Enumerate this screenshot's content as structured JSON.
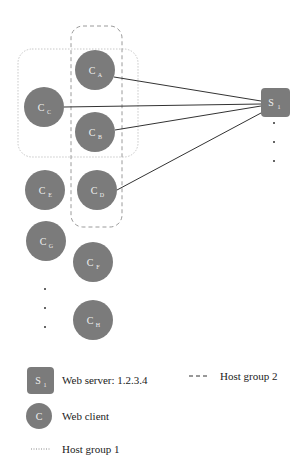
{
  "diagram": {
    "colors": {
      "node_fill": "#7b7b7b",
      "node_text": "#f2f2f2",
      "edge": "#333333",
      "host_group_1": "#c8c8c8",
      "host_group_2": "#9a9a9a"
    },
    "server": {
      "id": "S1",
      "main": "S",
      "sub": "1",
      "x": 261,
      "y": 88,
      "w": 29,
      "h": 29
    },
    "server_continuation_dots": [
      {
        "x": 274,
        "y": 123
      },
      {
        "x": 274,
        "y": 142
      },
      {
        "x": 274,
        "y": 161
      }
    ],
    "clients": [
      {
        "id": "CA",
        "main": "C",
        "sub": "A",
        "cx": 95,
        "cy": 70
      },
      {
        "id": "CC",
        "main": "C",
        "sub": "C",
        "cx": 44,
        "cy": 107
      },
      {
        "id": "CB",
        "main": "C",
        "sub": "B",
        "cx": 95,
        "cy": 132
      },
      {
        "id": "CE",
        "main": "C",
        "sub": "E",
        "cx": 45,
        "cy": 190
      },
      {
        "id": "CD",
        "main": "C",
        "sub": "D",
        "cx": 97,
        "cy": 190
      },
      {
        "id": "CG",
        "main": "C",
        "sub": "G",
        "cx": 46,
        "cy": 241
      },
      {
        "id": "CF",
        "main": "C",
        "sub": "F",
        "cx": 93,
        "cy": 262
      },
      {
        "id": "CH",
        "main": "C",
        "sub": "H",
        "cx": 93,
        "cy": 320
      }
    ],
    "client_continuation_dots": [
      {
        "x": 45,
        "y": 289
      },
      {
        "x": 45,
        "y": 308
      },
      {
        "x": 45,
        "y": 327
      }
    ],
    "edges": [
      {
        "from": "CA",
        "to": "S1"
      },
      {
        "from": "CC",
        "to": "S1"
      },
      {
        "from": "CB",
        "to": "S1"
      },
      {
        "from": "CD",
        "to": "S1"
      }
    ],
    "host_group_1": {
      "label": "Host group 1",
      "style": "dotted",
      "members": [
        "CA",
        "CB",
        "CC"
      ]
    },
    "host_group_2": {
      "label": "Host group 2",
      "style": "dashed",
      "members": [
        "CA",
        "CB",
        "CD"
      ]
    }
  },
  "legend": {
    "server_icon": {
      "main": "S",
      "sub": "1"
    },
    "server_label": "Web server: 1.2.3.4",
    "client_icon": {
      "main": "C"
    },
    "client_label": "Web client",
    "host_group_1_label": "Host group 1",
    "host_group_2_label": "Host group 2"
  }
}
